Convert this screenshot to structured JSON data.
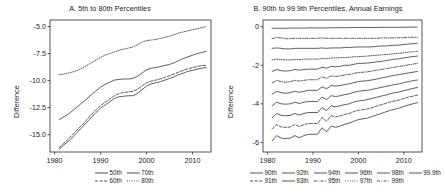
{
  "figure": {
    "width": 440,
    "height": 195,
    "background": "#ffffff",
    "line_color": "#2a2a2a"
  },
  "panels": [
    {
      "id": "panel-a",
      "title": "A. 5th to 80th Percentiles",
      "ylabel": "Difference",
      "legend": [
        [
          {
            "label": "50th",
            "dash": "solid"
          },
          {
            "label": "70th",
            "dash": "solid"
          }
        ],
        [
          {
            "label": "60th",
            "dash": "dashed"
          },
          {
            "label": "80th",
            "dash": "dotted"
          }
        ]
      ]
    },
    {
      "id": "panel-b",
      "title": "B. 90th to 99.9th Percentiles,  Annual Earnings",
      "ylabel": "Difference",
      "legend": [
        [
          {
            "label": "90th",
            "dash": "solid"
          },
          {
            "label": "92th",
            "dash": "solid"
          },
          {
            "label": "94th",
            "dash": "solid"
          },
          {
            "label": "96th",
            "dash": "solid"
          },
          {
            "label": "98th",
            "dash": "solid"
          },
          {
            "label": "99.9th",
            "dash": "solid"
          }
        ],
        [
          {
            "label": "91th",
            "dash": "dashed"
          },
          {
            "label": "93th",
            "dash": "solid"
          },
          {
            "label": "95th",
            "dash": "dash-dot"
          },
          {
            "label": "97th",
            "dash": "dotted"
          },
          {
            "label": "99th",
            "dash": "dash-dot"
          }
        ]
      ]
    }
  ],
  "chart_data": [
    {
      "type": "line",
      "title": "A. 5th to 80th Percentiles",
      "xlabel": "",
      "ylabel": "Difference",
      "xlim": [
        1979,
        2014
      ],
      "ylim": [
        -16.6,
        -4.4
      ],
      "xticks": [
        1980,
        1990,
        2000,
        2010
      ],
      "yticks": [
        -5.0,
        -7.5,
        -10.0,
        -12.5,
        -15.0
      ],
      "ytick_labels": [
        "-5.0",
        "-7.5",
        "-10.0",
        "-12.5",
        "-15.0"
      ],
      "grid": false,
      "legend_position": "below",
      "x": [
        1981,
        1982,
        1983,
        1984,
        1985,
        1986,
        1987,
        1988,
        1989,
        1990,
        1991,
        1992,
        1993,
        1994,
        1995,
        1996,
        1997,
        1998,
        1999,
        2000,
        2001,
        2002,
        2003,
        2004,
        2005,
        2006,
        2007,
        2008,
        2009,
        2010,
        2011,
        2012,
        2013
      ],
      "series": [
        {
          "name": "80th",
          "dash": "dotted",
          "values": [
            -9.45,
            -9.4,
            -9.3,
            -9.2,
            -9.05,
            -8.85,
            -8.6,
            -8.35,
            -8.1,
            -7.85,
            -7.65,
            -7.5,
            -7.35,
            -7.2,
            -7.1,
            -7.0,
            -6.9,
            -6.7,
            -6.45,
            -6.3,
            -6.25,
            -6.2,
            -6.1,
            -6.0,
            -5.9,
            -5.75,
            -5.6,
            -5.5,
            -5.4,
            -5.3,
            -5.2,
            -5.1,
            -5.0
          ]
        },
        {
          "name": "70th",
          "dash": "solid",
          "values": [
            -13.6,
            -13.35,
            -13.1,
            -12.75,
            -12.4,
            -12.05,
            -11.7,
            -11.3,
            -10.95,
            -10.6,
            -10.35,
            -10.15,
            -9.95,
            -9.9,
            -9.85,
            -9.85,
            -9.8,
            -9.6,
            -9.3,
            -9.0,
            -8.85,
            -8.8,
            -8.7,
            -8.6,
            -8.5,
            -8.35,
            -8.15,
            -7.95,
            -7.8,
            -7.65,
            -7.5,
            -7.4,
            -7.3
          ]
        },
        {
          "name": "60th",
          "dash": "dashed",
          "values": [
            -16.2,
            -15.8,
            -15.4,
            -14.95,
            -14.5,
            -14.1,
            -13.6,
            -13.15,
            -12.7,
            -12.3,
            -12.0,
            -11.7,
            -11.4,
            -11.2,
            -11.1,
            -11.05,
            -11.0,
            -10.8,
            -10.5,
            -10.2,
            -10.05,
            -9.95,
            -9.85,
            -9.7,
            -9.55,
            -9.4,
            -9.2,
            -9.05,
            -8.9,
            -8.8,
            -8.7,
            -8.6,
            -8.6
          ]
        },
        {
          "name": "50th",
          "dash": "solid",
          "values": [
            -16.35,
            -15.95,
            -15.6,
            -15.2,
            -14.75,
            -14.3,
            -13.85,
            -13.4,
            -12.95,
            -12.55,
            -12.25,
            -11.95,
            -11.65,
            -11.5,
            -11.45,
            -11.4,
            -11.4,
            -11.2,
            -10.85,
            -10.5,
            -10.3,
            -10.2,
            -10.1,
            -9.95,
            -9.8,
            -9.65,
            -9.45,
            -9.3,
            -9.15,
            -9.05,
            -8.95,
            -8.85,
            -8.8
          ]
        }
      ]
    },
    {
      "type": "line",
      "title": "B. 90th to 99.9th Percentiles,  Annual Earnings",
      "xlabel": "",
      "ylabel": "Difference",
      "xlim": [
        1979,
        2014
      ],
      "ylim": [
        -6.5,
        0.35
      ],
      "xticks": [
        1980,
        1990,
        2000,
        2010
      ],
      "yticks": [
        0,
        -2,
        -4,
        -6
      ],
      "ytick_labels": [
        "0",
        "-2",
        "-4",
        "-6"
      ],
      "grid": false,
      "legend_position": "below",
      "x": [
        1981,
        1982,
        1983,
        1984,
        1985,
        1986,
        1987,
        1988,
        1989,
        1990,
        1991,
        1992,
        1993,
        1994,
        1995,
        1996,
        1997,
        1998,
        1999,
        2000,
        2001,
        2002,
        2003,
        2004,
        2005,
        2006,
        2007,
        2008,
        2009,
        2010,
        2011,
        2012,
        2013
      ],
      "series": [
        {
          "name": "99.9th",
          "dash": "solid",
          "values": [
            -0.08,
            -0.08,
            -0.08,
            -0.08,
            -0.07,
            -0.07,
            -0.07,
            -0.07,
            -0.06,
            -0.06,
            -0.06,
            -0.06,
            -0.06,
            -0.05,
            -0.05,
            -0.05,
            -0.05,
            -0.05,
            -0.04,
            -0.04,
            -0.04,
            -0.04,
            -0.04,
            -0.04,
            -0.03,
            -0.03,
            -0.03,
            -0.03,
            -0.03,
            -0.03,
            -0.02,
            -0.02,
            -0.02
          ]
        },
        {
          "name": "99th",
          "dash": "dash-dot",
          "values": [
            -0.62,
            -0.55,
            -0.58,
            -0.62,
            -0.62,
            -0.6,
            -0.6,
            -0.6,
            -0.6,
            -0.6,
            -0.6,
            -0.58,
            -0.6,
            -0.6,
            -0.6,
            -0.6,
            -0.6,
            -0.6,
            -0.6,
            -0.6,
            -0.6,
            -0.6,
            -0.6,
            -0.6,
            -0.58,
            -0.58,
            -0.58,
            -0.58,
            -0.57,
            -0.56,
            -0.55,
            -0.55,
            -0.55
          ]
        },
        {
          "name": "98th",
          "dash": "solid",
          "values": [
            -1.12,
            -1.1,
            -1.12,
            -1.15,
            -1.15,
            -1.12,
            -1.12,
            -1.12,
            -1.12,
            -1.12,
            -1.12,
            -1.1,
            -1.12,
            -1.1,
            -1.1,
            -1.1,
            -1.08,
            -1.08,
            -1.06,
            -1.05,
            -1.05,
            -1.05,
            -1.04,
            -1.02,
            -1.0,
            -1.0,
            -0.98,
            -0.96,
            -0.95,
            -0.92,
            -0.9,
            -0.88,
            -0.86
          ]
        },
        {
          "name": "97th",
          "dash": "dotted",
          "values": [
            -1.72,
            -1.68,
            -1.7,
            -1.72,
            -1.72,
            -1.7,
            -1.7,
            -1.68,
            -1.68,
            -1.68,
            -1.68,
            -1.65,
            -1.66,
            -1.62,
            -1.62,
            -1.6,
            -1.6,
            -1.58,
            -1.56,
            -1.55,
            -1.54,
            -1.52,
            -1.5,
            -1.48,
            -1.46,
            -1.44,
            -1.42,
            -1.4,
            -1.38,
            -1.35,
            -1.32,
            -1.3,
            -1.28
          ]
        },
        {
          "name": "96th",
          "dash": "solid",
          "values": [
            -2.32,
            -2.22,
            -2.28,
            -2.3,
            -2.28,
            -2.22,
            -2.25,
            -2.22,
            -2.2,
            -2.2,
            -2.2,
            -2.1,
            -2.15,
            -2.05,
            -2.08,
            -2.05,
            -2.0,
            -2.0,
            -1.95,
            -1.9,
            -1.9,
            -1.88,
            -1.86,
            -1.82,
            -1.8,
            -1.76,
            -1.72,
            -1.68,
            -1.66,
            -1.62,
            -1.58,
            -1.55,
            -1.52
          ]
        },
        {
          "name": "95th",
          "dash": "dash-dot",
          "values": [
            -2.92,
            -2.78,
            -2.85,
            -2.88,
            -2.85,
            -2.78,
            -2.82,
            -2.78,
            -2.75,
            -2.75,
            -2.75,
            -2.6,
            -2.68,
            -2.55,
            -2.58,
            -2.55,
            -2.5,
            -2.48,
            -2.42,
            -2.38,
            -2.36,
            -2.34,
            -2.3,
            -2.26,
            -2.22,
            -2.18,
            -2.14,
            -2.1,
            -2.06,
            -2.02,
            -1.98,
            -1.94,
            -1.9
          ]
        },
        {
          "name": "94th",
          "dash": "solid",
          "values": [
            -3.5,
            -3.35,
            -3.42,
            -3.45,
            -3.42,
            -3.35,
            -3.4,
            -3.35,
            -3.3,
            -3.3,
            -3.3,
            -3.12,
            -3.22,
            -3.05,
            -3.08,
            -3.05,
            -3.0,
            -2.96,
            -2.9,
            -2.85,
            -2.82,
            -2.8,
            -2.76,
            -2.72,
            -2.66,
            -2.62,
            -2.56,
            -2.52,
            -2.48,
            -2.44,
            -2.4,
            -2.36,
            -2.32
          ]
        },
        {
          "name": "93th",
          "dash": "solid",
          "values": [
            -4.1,
            -3.92,
            -4.0,
            -4.02,
            -4.0,
            -3.92,
            -3.98,
            -3.92,
            -3.88,
            -3.88,
            -3.88,
            -3.65,
            -3.78,
            -3.58,
            -3.62,
            -3.58,
            -3.52,
            -3.48,
            -3.4,
            -3.35,
            -3.32,
            -3.3,
            -3.25,
            -3.2,
            -3.15,
            -3.1,
            -3.05,
            -3.0,
            -2.96,
            -2.9,
            -2.85,
            -2.8,
            -2.76
          ]
        },
        {
          "name": "92th",
          "dash": "solid",
          "values": [
            -4.72,
            -4.5,
            -4.6,
            -4.62,
            -4.6,
            -4.5,
            -4.58,
            -4.5,
            -4.45,
            -4.45,
            -4.45,
            -4.2,
            -4.35,
            -4.1,
            -4.15,
            -4.1,
            -4.04,
            -4.0,
            -3.9,
            -3.85,
            -3.82,
            -3.78,
            -3.72,
            -3.66,
            -3.6,
            -3.55,
            -3.48,
            -3.42,
            -3.38,
            -3.32,
            -3.26,
            -3.2,
            -3.15
          ]
        },
        {
          "name": "91th",
          "dash": "dashed",
          "values": [
            -5.32,
            -5.08,
            -5.2,
            -5.22,
            -5.2,
            -5.08,
            -5.18,
            -5.08,
            -5.02,
            -5.02,
            -5.02,
            -4.72,
            -4.9,
            -4.62,
            -4.68,
            -4.62,
            -4.55,
            -4.5,
            -4.4,
            -4.34,
            -4.3,
            -4.26,
            -4.2,
            -4.12,
            -4.05,
            -3.98,
            -3.9,
            -3.85,
            -3.8,
            -3.72,
            -3.65,
            -3.6,
            -3.55
          ]
        },
        {
          "name": "90th",
          "dash": "solid",
          "values": [
            -5.92,
            -5.65,
            -5.78,
            -5.8,
            -5.78,
            -5.65,
            -5.76,
            -5.65,
            -5.58,
            -5.58,
            -5.58,
            -5.25,
            -5.45,
            -5.15,
            -5.22,
            -5.15,
            -5.06,
            -5.0,
            -4.9,
            -4.82,
            -4.78,
            -4.74,
            -4.66,
            -4.58,
            -4.5,
            -4.42,
            -4.34,
            -4.28,
            -4.22,
            -4.14,
            -4.06,
            -4.0,
            -3.94
          ]
        }
      ]
    }
  ]
}
